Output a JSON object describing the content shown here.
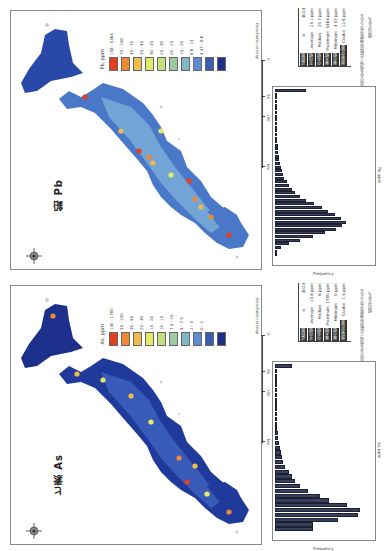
{
  "page": {
    "orientation": "rotated-90-ccw"
  },
  "panels": [
    {
      "id": "pb",
      "title": "鉛 Pb",
      "legend": {
        "unit": "Pb, ppm",
        "classes": [
          {
            "label": "158 - 5364",
            "color": "#e4401f"
          },
          {
            "label": "75 - 158",
            "color": "#ee8a36"
          },
          {
            "label": "45 - 75",
            "color": "#f1bb4c"
          },
          {
            "label": "35 - 45",
            "color": "#e6e868"
          },
          {
            "label": "30 - 35",
            "color": "#c4df7e"
          },
          {
            "label": "25 - 30",
            "color": "#9dcba0"
          },
          {
            "label": "20 - 25",
            "color": "#7cb8c8"
          },
          {
            "label": "15 - 20",
            "color": "#5a8ed0"
          },
          {
            "label": "8.6 - 15",
            "color": "#3a5cb0"
          },
          {
            "label": "4.57 - 8.6",
            "color": "#1c2f8a"
          }
        ]
      },
      "map_label": "Geochemical map",
      "scale": {
        "ticks": [
          "0",
          "50",
          "100",
          "200 km"
        ]
      },
      "stats": {
        "rows": [
          {
            "key": "試料数",
            "sym": "n",
            "value": "3024"
          },
          {
            "key": "平均値",
            "sym": "Average",
            "value": "25.1 ppm"
          },
          {
            "key": "中央値",
            "sym": "Median",
            "value": "20.7 ppm"
          },
          {
            "key": "最大値",
            "sym": "Maximum",
            "value": "5364 ppm"
          },
          {
            "key": "最小値",
            "sym": "Minimum",
            "value": "4.57 ppm"
          },
          {
            "key": "地殻存在度",
            "sym": "Clarke",
            "value": "12.6 ppm"
          }
        ]
      },
      "note": [
        "鉱床のある地域で比較的高濃度が見られる",
        "傾向がある。"
      ],
      "histogram": {
        "xlabel": "Pb, ppm",
        "ylabel": "Frequency",
        "ytick_labels": [
          "0",
          "50",
          "100",
          "150",
          "200",
          "250",
          "300"
        ]
      }
    },
    {
      "id": "as",
      "title": "ヒ素 As",
      "legend": {
        "unit": "As, ppm",
        "classes": [
          {
            "label": "150 - 1700",
            "color": "#e4401f"
          },
          {
            "label": "55 - 150",
            "color": "#ee8a36"
          },
          {
            "label": "30 - 55",
            "color": "#f1bb4c"
          },
          {
            "label": "20 - 30",
            "color": "#e6e868"
          },
          {
            "label": "15 - 20",
            "color": "#c4df7e"
          },
          {
            "label": "10 - 15",
            "color": "#9dcba0"
          },
          {
            "label": "7.5 - 10",
            "color": "#7cb8c8"
          },
          {
            "label": "5 - 7.5",
            "color": "#5a8ed0"
          },
          {
            "label": "2 - 5",
            "color": "#3a5cb0"
          },
          {
            "label": "0 - 2",
            "color": "#1c2f8a"
          }
        ]
      },
      "map_label": "Geochemical map",
      "scale": {
        "ticks": [
          "0",
          "50",
          "100",
          "200 km"
        ]
      },
      "stats": {
        "rows": [
          {
            "key": "試料数",
            "sym": "n",
            "value": "3024"
          },
          {
            "key": "平均値",
            "sym": "Average",
            "value": "13.8 ppm"
          },
          {
            "key": "中央値",
            "sym": "Median",
            "value": "6 ppm"
          },
          {
            "key": "最大値",
            "sym": "Maximum",
            "value": "1700 ppm"
          },
          {
            "key": "最小値",
            "sym": "Minimum",
            "value": "0 ppm"
          },
          {
            "key": "地殻存在度",
            "sym": "Clarke",
            "value": "1.5 ppm"
          }
        ]
      },
      "note": [
        "鉱床のある地域で比較的高濃度が見られる",
        "傾向がある。"
      ],
      "histogram": {
        "xlabel": "As, ppm",
        "ylabel": "Frequency",
        "ytick_labels": [
          "0",
          "50",
          "100",
          "150",
          "200",
          "250",
          "300",
          "350",
          "400",
          "450"
        ]
      }
    }
  ],
  "chart_data": [
    {
      "type": "bar",
      "title": "Pb histogram",
      "xlabel": "Pb, ppm",
      "ylabel": "Frequency",
      "orientation": "horizontal (page rotated)",
      "values": [
        2,
        5,
        20,
        45,
        80,
        120,
        160,
        195,
        215,
        225,
        210,
        190,
        170,
        150,
        125,
        100,
        80,
        65,
        55,
        45,
        38,
        30,
        26,
        22,
        18,
        16,
        14,
        12,
        10,
        9,
        8,
        7,
        6,
        5,
        5,
        4,
        4,
        3,
        3,
        2,
        2,
        2,
        1,
        1,
        1,
        100
      ],
      "ylim": [
        0,
        300
      ]
    },
    {
      "type": "bar",
      "title": "As histogram",
      "xlabel": "As, ppm",
      "ylabel": "Frequency",
      "orientation": "horizontal (page rotated)",
      "values": [
        180,
        180,
        300,
        395,
        405,
        345,
        260,
        215,
        160,
        120,
        95,
        80,
        65,
        50,
        40,
        35,
        30,
        25,
        20,
        15,
        12,
        10,
        8,
        6,
        5,
        4,
        3,
        2,
        2,
        1,
        1,
        1,
        1,
        1,
        80
      ],
      "ylim": [
        0,
        450
      ]
    }
  ]
}
